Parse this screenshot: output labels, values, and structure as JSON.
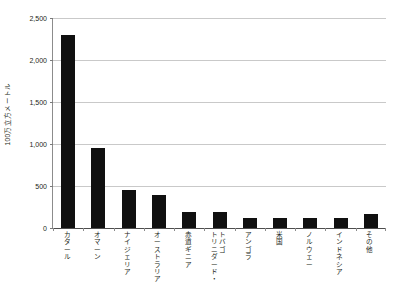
{
  "chart_data": {
    "type": "bar",
    "title": "",
    "subtitle": "",
    "xlabel": "",
    "ylabel": "100万立方メートル",
    "ylim": [
      0,
      2500
    ],
    "ytick_values": [
      0,
      500,
      1000,
      1500,
      2000,
      2500
    ],
    "ytick_labels": [
      "0",
      "500",
      "1,000",
      "1,500",
      "2,000",
      "2,500"
    ],
    "grid": true,
    "legend": false,
    "legend_position": "none",
    "bar_color": "#101010",
    "categories": [
      "カタール",
      "オマーン",
      "ナイジェリア",
      "オーストラリア",
      "赤道ギニア",
      "トリニダード・トバゴ",
      "アンゴラ",
      "米国",
      "ノルウェー",
      "インドネシア",
      "その他"
    ],
    "values": [
      2300,
      950,
      450,
      390,
      195,
      185,
      115,
      120,
      115,
      120,
      165
    ],
    "series": [
      {
        "name": "",
        "values": [
          2300,
          950,
          450,
          390,
          195,
          185,
          115,
          120,
          115,
          120,
          165
        ]
      }
    ]
  },
  "axes": {
    "y_title": "100万立方メートル",
    "y_ticks": [
      {
        "label": "2,500",
        "value": 2500
      },
      {
        "label": "2,000",
        "value": 2000
      },
      {
        "label": "1,500",
        "value": 1500
      },
      {
        "label": "1,000",
        "value": 1000
      },
      {
        "label": "500",
        "value": 500
      },
      {
        "label": "0",
        "value": 0
      }
    ]
  },
  "x_categories": [
    {
      "label": "カタール"
    },
    {
      "label": "オマーン"
    },
    {
      "label": "ナイジェリア"
    },
    {
      "label": "オーストラリア"
    },
    {
      "label": "赤道ギニア"
    },
    {
      "label": "トリニダード・トバゴ"
    },
    {
      "label": "アンゴラ"
    },
    {
      "label": "米国"
    },
    {
      "label": "ノルウェー"
    },
    {
      "label": "インドネシア"
    },
    {
      "label": "その他"
    }
  ]
}
